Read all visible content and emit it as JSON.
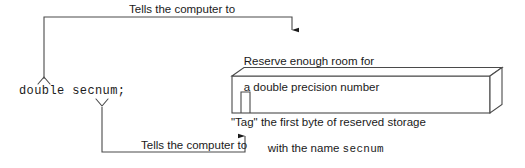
{
  "diagram": {
    "type": "annotated-code-declaration",
    "topic": "C double variable declaration memory allocation",
    "code_declaration": "double secnum;",
    "annotations": {
      "top_label": "Tells the computer to",
      "bottom_label": "Tells the computer to",
      "reserve_text_line1": "Reserve enough room for",
      "reserve_text_line2": "a double precision number",
      "tag_text_line1": "\"Tag\" the first byte of reserved storage",
      "tag_text_line2_prefix": "with the name ",
      "tag_text_line2_identifier": "secnum"
    },
    "memory_block": {
      "label": "reserved-storage-block",
      "tagged_byte_label": "first-byte-tag"
    },
    "colors": {
      "stroke": "#4a4a4a",
      "text": "#1a1a1a",
      "background": "#ffffff",
      "arrow_fill": "#1a1a1a"
    }
  }
}
